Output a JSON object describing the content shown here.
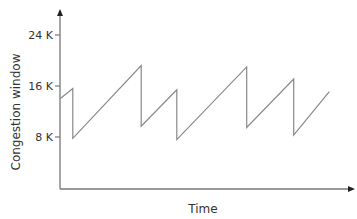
{
  "chart_data": {
    "type": "line",
    "title": "",
    "xlabel": "Time",
    "ylabel": "Congestion window",
    "yticks": [
      {
        "value": 8,
        "label": "8 K"
      },
      {
        "value": 16,
        "label": "16 K"
      },
      {
        "value": 24,
        "label": "24 K"
      }
    ],
    "ylim": [
      0,
      28
    ],
    "xlim": [
      0,
      100
    ],
    "grid": false,
    "legend": null,
    "series": [
      {
        "name": "Congestion window",
        "color": "#888888",
        "points": [
          {
            "x": 0,
            "y": 14
          },
          {
            "x": 4.5,
            "y": 15.6
          },
          {
            "x": 4.5,
            "y": 7.8
          },
          {
            "x": 28.5,
            "y": 19.2
          },
          {
            "x": 28.5,
            "y": 9.7
          },
          {
            "x": 41,
            "y": 15.4
          },
          {
            "x": 41,
            "y": 7.6
          },
          {
            "x": 65.5,
            "y": 19
          },
          {
            "x": 65.5,
            "y": 9.5
          },
          {
            "x": 82,
            "y": 17.1
          },
          {
            "x": 82,
            "y": 8.3
          },
          {
            "x": 94.5,
            "y": 15.1
          }
        ]
      }
    ]
  }
}
